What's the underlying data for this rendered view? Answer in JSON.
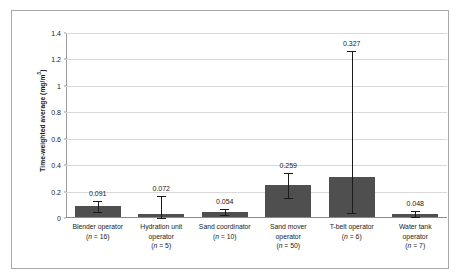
{
  "chart_data": {
    "type": "bar",
    "title": "",
    "xlabel": "",
    "ylabel": "Time-weighted average (mg/m³)",
    "ylim": [
      0,
      1.4
    ],
    "yticks": [
      "0",
      "0.2",
      "0.4",
      "0.6",
      "0.8",
      "1",
      "1.2",
      "1.4"
    ],
    "ytick_values": [
      0,
      0.2,
      0.4,
      0.6,
      0.8,
      1.0,
      1.2,
      1.4
    ],
    "grid": true,
    "legend": "none",
    "bar_color": "#4f4f4f",
    "categories": [
      "Blender operator",
      "Hydration unit operator",
      "Sand coordinator",
      "Sand mover operator",
      "T-belt operator",
      "Water tank operator"
    ],
    "category_lines": [
      [
        "Blender operator",
        "(n = 16)"
      ],
      [
        "Hydration unit",
        "operator",
        "(n = 5)"
      ],
      [
        "Sand coordinator",
        "(n = 10)"
      ],
      [
        "Sand mover",
        "operator",
        "(n = 50)"
      ],
      [
        "T-belt operator",
        "(n = 6)"
      ],
      [
        "Water tank",
        "operator",
        "(n = 7)"
      ]
    ],
    "sample_sizes": [
      16,
      5,
      10,
      50,
      6,
      7
    ],
    "values": [
      0.082,
      0.022,
      0.036,
      0.243,
      0.305,
      0.025
    ],
    "data_labels": [
      "0.091",
      "0.072",
      "0.054",
      "0.259",
      "0.327",
      "0.048"
    ],
    "error_high": [
      0.128,
      0.163,
      0.066,
      0.337,
      1.265,
      0.054
    ],
    "error_low": [
      0.049,
      0.0,
      0.019,
      0.15,
      0.035,
      0.01
    ]
  },
  "axis": {
    "y_title": "Time-weighted average (mg/m",
    "y_title_sup": "3",
    "y_title_tail": ")"
  }
}
